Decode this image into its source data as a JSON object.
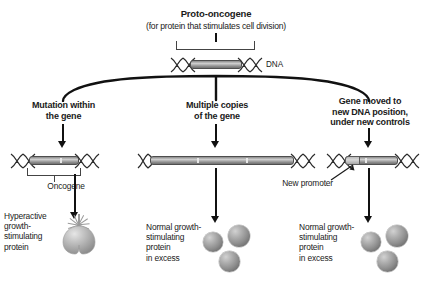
{
  "diagram": {
    "title": "Proto-oncogene",
    "subtitle": "(for protein that stimulates cell division)",
    "dna_label": "DNA"
  },
  "branches": [
    {
      "id": "mutation",
      "heading_line1": "Mutation within",
      "heading_line2": "the gene",
      "gene_label": "Oncogene",
      "result_lines": [
        "Hyperactive",
        "growth-",
        "stimulating",
        "protein"
      ],
      "protein_type": "hyperactive-protein",
      "protein_count": 1
    },
    {
      "id": "multiple-copies",
      "heading_line1": "Multiple copies",
      "heading_line2": "of the gene",
      "gene_label": "",
      "result_lines": [
        "Normal growth-",
        "stimulating",
        "protein",
        "in excess"
      ],
      "protein_type": "normal-protein",
      "protein_count": 3
    },
    {
      "id": "gene-moved",
      "heading_line1": "Gene moved to",
      "heading_line2": "new DNA position,",
      "heading_line3": "under new controls",
      "gene_label": "New promoter",
      "result_lines": [
        "Normal growth-",
        "stimulating",
        "protein",
        "in excess"
      ],
      "protein_type": "normal-protein",
      "protein_count": 3
    }
  ],
  "colors": {
    "ink": "#1a1a1a",
    "gene_gray": "#a8a8a8",
    "protein_gray": "#8e8e8e",
    "connector": "#111111"
  }
}
